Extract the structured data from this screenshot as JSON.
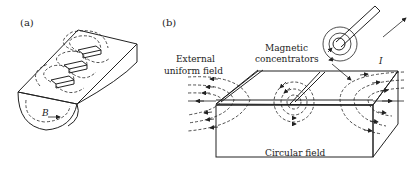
{
  "figure": {
    "panel_a": {
      "label": "(a)",
      "field_symbol": "B"
    },
    "panel_b": {
      "label": "(b)",
      "annotations": {
        "external_field": [
          "External",
          "uniform field"
        ],
        "concentrators": [
          "Magnetic",
          "concentrators"
        ],
        "current": "I",
        "circular_field": "Circular field"
      }
    },
    "colors": {
      "line": "#222222",
      "shade": "#d0d0d0",
      "background": "#ffffff"
    }
  }
}
